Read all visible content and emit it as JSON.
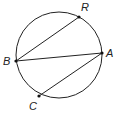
{
  "diagram": {
    "type": "circle-with-chords",
    "circle": {
      "cx": 59,
      "cy": 55,
      "r": 43
    },
    "points": [
      {
        "name": "R",
        "x": 79,
        "y": 17,
        "label_x": 81,
        "label_y": 2
      },
      {
        "name": "A",
        "x": 102,
        "y": 53,
        "label_x": 106,
        "label_y": 49
      },
      {
        "name": "B",
        "x": 16,
        "y": 61,
        "label_x": 3,
        "label_y": 56
      },
      {
        "name": "C",
        "x": 39,
        "y": 96,
        "label_x": 29,
        "label_y": 101
      }
    ],
    "chords": [
      [
        "B",
        "R"
      ],
      [
        "B",
        "A"
      ],
      [
        "A",
        "C"
      ]
    ],
    "labels": {
      "R": "R",
      "A": "A",
      "B": "B",
      "C": "C"
    },
    "stroke_color": "#222222"
  }
}
